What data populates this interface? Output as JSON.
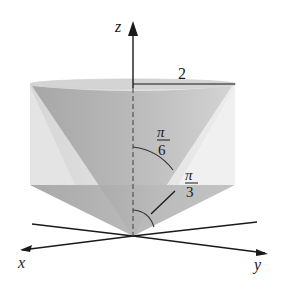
{
  "figure": {
    "axes": {
      "z_label": "z",
      "x_label": "x",
      "y_label": "y"
    },
    "labels": {
      "radius": "2",
      "angle_inner_num": "π",
      "angle_inner_den": "6",
      "angle_outer_num": "π",
      "angle_outer_den": "3"
    },
    "colors": {
      "cylinder_light": "#d9d9d9",
      "cylinder_lighter": "#e8e8e8",
      "inner_cone_dark": "#a8a8a8",
      "inner_cone_mid": "#bcbcbc",
      "lower_cone": "#b3b3b3",
      "line": "#1a1a1a"
    }
  }
}
